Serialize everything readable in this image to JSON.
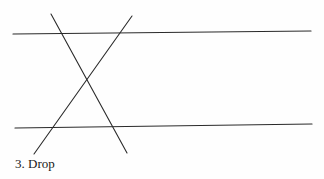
{
  "caption": "3. Drop",
  "colors": {
    "background": "#fefefe",
    "line": "#2a2a2a"
  },
  "diagram": {
    "type": "two parallel lines cut by two crossing transversals",
    "lines": [
      {
        "name": "top-parallel-line",
        "x1": 13,
        "y1": 34,
        "x2": 311,
        "y2": 31
      },
      {
        "name": "bottom-parallel-line",
        "x1": 15,
        "y1": 128,
        "x2": 312,
        "y2": 124
      },
      {
        "name": "transversal-descending",
        "x1": 51,
        "y1": 14,
        "x2": 127,
        "y2": 153
      },
      {
        "name": "transversal-ascending",
        "x1": 132,
        "y1": 16,
        "x2": 34,
        "y2": 154
      }
    ]
  }
}
